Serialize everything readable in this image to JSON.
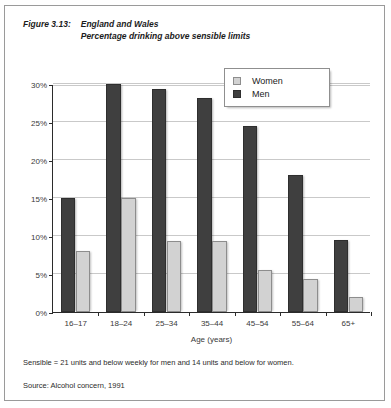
{
  "figure": {
    "label": "Figure 3.13:",
    "title_line1": "England and Wales",
    "title_line2": "Percentage drinking above sensible limits"
  },
  "legend": {
    "position": "top-right",
    "items": [
      {
        "label": "Women",
        "color": "#d2d2d2",
        "swatch": "women"
      },
      {
        "label": "Men",
        "color": "#3f3f3f",
        "swatch": "men"
      }
    ]
  },
  "footnotes": {
    "note": "Sensible = 21 units and below weekly for men and 14 units and below for women.",
    "source": "Source: Alcohol concern, 1991"
  },
  "axis": {
    "y_ticks": [
      "0%",
      "5%",
      "10%",
      "15%",
      "20%",
      "25%",
      "30%"
    ],
    "y_values": [
      0,
      5,
      10,
      15,
      20,
      25,
      30
    ],
    "x_title": "Age (years)"
  },
  "chart_data": {
    "type": "bar",
    "subtitle": "Percentage drinking above sensible limits",
    "xlabel": "Age (years)",
    "ylabel": "",
    "ylim": [
      0,
      30
    ],
    "ytick_format": "percent",
    "yticks": [
      0,
      5,
      10,
      15,
      20,
      25,
      30
    ],
    "grid": true,
    "legend_position": "top-right",
    "categories": [
      "16–17",
      "18–24",
      "25–34",
      "35–44",
      "45–54",
      "55–64",
      "65+"
    ],
    "series": [
      {
        "name": "Men",
        "color": "#3f3f3f",
        "values": [
          15.0,
          30.0,
          29.4,
          28.1,
          24.5,
          18.0,
          9.5
        ]
      },
      {
        "name": "Women",
        "color": "#d2d2d2",
        "values": [
          8.0,
          15.0,
          9.3,
          9.3,
          5.5,
          4.3,
          2.0
        ]
      }
    ],
    "series_draw_order": [
      "Men",
      "Women"
    ]
  }
}
